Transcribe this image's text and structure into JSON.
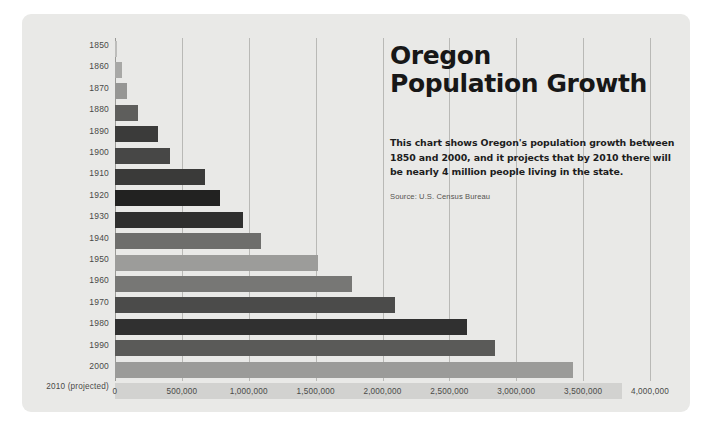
{
  "card": {
    "background": "#e9e9e7"
  },
  "headline": {
    "line1": "Oregon",
    "line2": "Population Growth"
  },
  "blurb": {
    "text": "This chart shows Oregon's population growth between 1850 and 2000, and it projects that by 2010 there will be nearly 4 million people living in the state."
  },
  "source": {
    "text": "Source: U.S. Census Bureau"
  },
  "chart_data": {
    "type": "bar",
    "orientation": "horizontal",
    "title": "Oregon Population Growth",
    "xlabel": "",
    "ylabel": "",
    "xlim": [
      0,
      4000000
    ],
    "grid": true,
    "legend": "none",
    "xticks": [
      0,
      500000,
      1000000,
      1500000,
      2000000,
      2500000,
      3000000,
      3500000,
      4000000
    ],
    "xtick_labels": [
      "0",
      "500,000",
      "1,000,000",
      "1,500,000",
      "2,000,000",
      "2,500,000",
      "3,000,000",
      "3,500,000",
      "4,000,000"
    ],
    "categories": [
      "1850",
      "1860",
      "1870",
      "1880",
      "1890",
      "1900",
      "1910",
      "1920",
      "1930",
      "1940",
      "1950",
      "1960",
      "1970",
      "1980",
      "1990",
      "2000",
      "2010 (projected)"
    ],
    "values": [
      12000,
      52000,
      91000,
      175000,
      318000,
      414000,
      673000,
      783000,
      954000,
      1090000,
      1521000,
      1769000,
      2092000,
      2633000,
      2842000,
      3421000,
      3791000
    ],
    "bar_colors": [
      "#bdbdbb",
      "#a8a8a6",
      "#969694",
      "#5e5e5c",
      "#3b3b3a",
      "#474746",
      "#3a3a39",
      "#222221",
      "#2f2f2e",
      "#6e6e6c",
      "#9c9c9a",
      "#777775",
      "#4b4b4a",
      "#303030",
      "#5a5a58",
      "#9b9b99",
      "#d2d2d0"
    ]
  }
}
